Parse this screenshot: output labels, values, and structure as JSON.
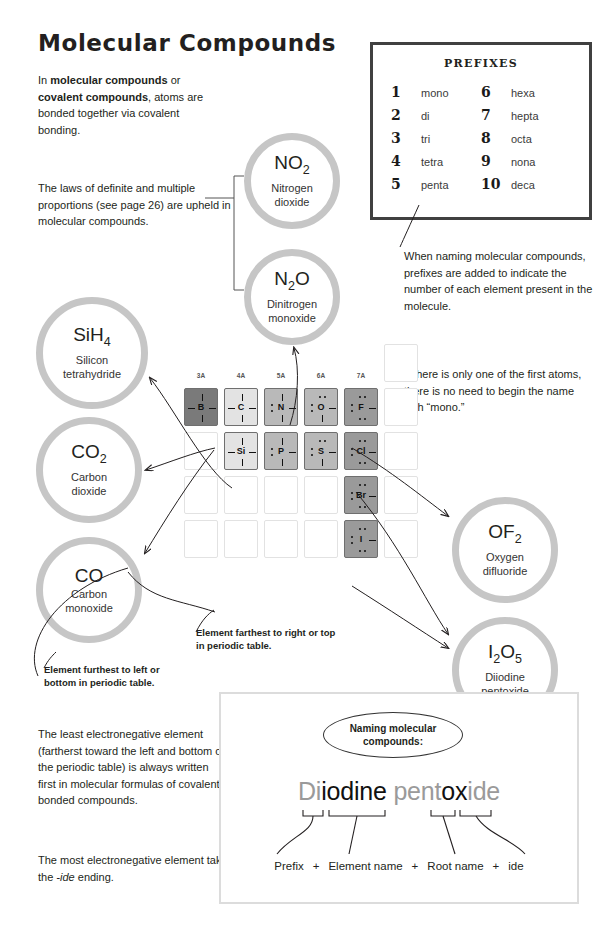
{
  "page": {
    "title": "Molecular Compounds"
  },
  "paragraphs": {
    "intro_pre": "In ",
    "intro_b1": "molecular compounds",
    "intro_mid": " or ",
    "intro_b2": "covalent compounds",
    "intro_post": ", atoms are bonded together via covalent bonding.",
    "laws": "The laws of definite and multiple proportions (see page 26) are upheld in molecular compounds.",
    "prefix_note": "When naming molecular compounds, prefixes are added to indicate the number of each element present in the molecule.",
    "mono_note": "If there is only one of the first atoms, there is no need to begin the name with “mono.”",
    "least_electroneg": "The least electronegative element (fartherst toward the left and bottom of the periodic table) is always written first in molecular formulas of covalently bonded compounds.",
    "most_pre": "The most electronegative element takes the ",
    "most_em": "-ide",
    "most_post": " ending."
  },
  "callouts": {
    "right_top": "Element farthest to right or top in periodic table.",
    "left_bottom": "Element furthest to left or bottom in periodic table."
  },
  "prefixes": {
    "heading": "PREFIXES",
    "left": [
      {
        "num": "1",
        "word": "mono"
      },
      {
        "num": "2",
        "word": "di"
      },
      {
        "num": "3",
        "word": "tri"
      },
      {
        "num": "4",
        "word": "tetra"
      },
      {
        "num": "5",
        "word": "penta"
      }
    ],
    "right": [
      {
        "num": "6",
        "word": "hexa"
      },
      {
        "num": "7",
        "word": "hepta"
      },
      {
        "num": "8",
        "word": "octa"
      },
      {
        "num": "9",
        "word": "nona"
      },
      {
        "num": "10",
        "word": "deca"
      }
    ]
  },
  "bubbles": [
    {
      "id": "no2",
      "formula_main": "NO",
      "formula_sub": "2",
      "name_line1": "Nitrogen",
      "name_line2": "dioxide"
    },
    {
      "id": "n2o",
      "formula_main": "N",
      "formula_sub": "2",
      "formula_tail": "O",
      "name_line1": "Dinitrogen",
      "name_line2": "monoxide"
    },
    {
      "id": "sih4",
      "formula_main": "SiH",
      "formula_sub": "4",
      "name_line1": "Silicon",
      "name_line2": "tetrahydride"
    },
    {
      "id": "co2",
      "formula_main": "CO",
      "formula_sub": "2",
      "name_line1": "Carbon",
      "name_line2": "dioxide"
    },
    {
      "id": "co",
      "formula_main": "CO",
      "formula_sub": "",
      "name_line1": "Carbon",
      "name_line2": "monoxide"
    },
    {
      "id": "of2",
      "formula_main": "OF",
      "formula_sub": "2",
      "name_line1": "Oxygen",
      "name_line2": "difluoride"
    },
    {
      "id": "i2o5",
      "formula_main": "I",
      "formula_sub": "2",
      "formula_tail": "O",
      "formula_sub2": "5",
      "name_line1": "Diiodine",
      "name_line2": "pentoxide"
    }
  ],
  "periodic_table": {
    "column_headers": [
      "3A",
      "4A",
      "5A",
      "6A",
      "7A",
      "8A"
    ],
    "elements": [
      {
        "symbol": "B",
        "group": "3A",
        "row": 1,
        "shade": "darkest",
        "lone_pairs": 0
      },
      {
        "symbol": "C",
        "group": "4A",
        "row": 1,
        "shade": "light",
        "lone_pairs": 0
      },
      {
        "symbol": "N",
        "group": "5A",
        "row": 1,
        "shade": "mid",
        "lone_pairs": 1
      },
      {
        "symbol": "O",
        "group": "6A",
        "row": 1,
        "shade": "mid",
        "lone_pairs": 2
      },
      {
        "symbol": "F",
        "group": "7A",
        "row": 1,
        "shade": "dark",
        "lone_pairs": 3
      },
      {
        "symbol": "Si",
        "group": "4A",
        "row": 2,
        "shade": "light",
        "lone_pairs": 0
      },
      {
        "symbol": "P",
        "group": "5A",
        "row": 2,
        "shade": "mid",
        "lone_pairs": 1
      },
      {
        "symbol": "S",
        "group": "6A",
        "row": 2,
        "shade": "mid",
        "lone_pairs": 2
      },
      {
        "symbol": "Cl",
        "group": "7A",
        "row": 2,
        "shade": "dark",
        "lone_pairs": 3
      },
      {
        "symbol": "Br",
        "group": "7A",
        "row": 3,
        "shade": "dark",
        "lone_pairs": 3
      },
      {
        "symbol": "I",
        "group": "7A",
        "row": 4,
        "shade": "dark",
        "lone_pairs": 3
      }
    ]
  },
  "naming_panel": {
    "oval_line1": "Naming molecular",
    "oval_line2": "compounds:",
    "word_parts": [
      {
        "text": "Di",
        "style": "gray"
      },
      {
        "text": "iodine",
        "style": "black"
      },
      {
        "text": " pent",
        "style": "gray"
      },
      {
        "text": "ox",
        "style": "black"
      },
      {
        "text": "ide",
        "style": "gray"
      }
    ],
    "legend": [
      "Prefix",
      "Element name",
      "Root name",
      "ide"
    ],
    "legend_sep": "+"
  }
}
